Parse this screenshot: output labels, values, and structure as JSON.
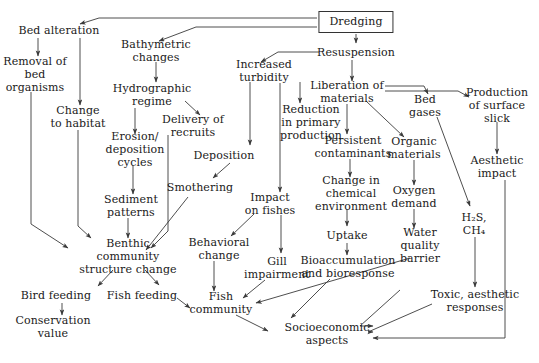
{
  "figure": {
    "type": "flowchart",
    "background_color": "#ffffff",
    "line_color": "#3a3a3a",
    "text_color": "#1a1a1a"
  },
  "nodes": [
    {
      "id": "dredging",
      "label": "Dredging",
      "x": 356,
      "y": 22,
      "boxed": true
    },
    {
      "id": "bed_alteration",
      "label": "Bed alteration",
      "x": 59,
      "y": 30,
      "boxed": false
    },
    {
      "id": "removal_bed_org",
      "label": "Removal of\nbed\norganisms",
      "x": 35,
      "y": 74,
      "boxed": false
    },
    {
      "id": "change_habitat",
      "label": "Change\nto habitat",
      "x": 78,
      "y": 117,
      "boxed": false
    },
    {
      "id": "bathymetric",
      "label": "Bathymetric\nchanges",
      "x": 156,
      "y": 51,
      "boxed": false
    },
    {
      "id": "hydrographic",
      "label": "Hydrographic\nregime",
      "x": 152,
      "y": 95,
      "boxed": false
    },
    {
      "id": "erosion",
      "label": "Erosion/\ndeposition\ncycles",
      "x": 135,
      "y": 149,
      "boxed": false
    },
    {
      "id": "sediment_patt",
      "label": "Sediment\npatterns",
      "x": 131,
      "y": 206,
      "boxed": false
    },
    {
      "id": "delivery",
      "label": "Delivery of\nrecruits",
      "x": 193,
      "y": 126,
      "boxed": false
    },
    {
      "id": "increased_turb",
      "label": "Increased\nturbidity",
      "x": 264,
      "y": 71,
      "boxed": false
    },
    {
      "id": "reduction_prim",
      "label": "Reduction\nin primary\nproduction",
      "x": 311,
      "y": 122,
      "boxed": false
    },
    {
      "id": "deposition",
      "label": "Deposition",
      "x": 224,
      "y": 155,
      "boxed": false
    },
    {
      "id": "smothering",
      "label": "Smothering",
      "x": 200,
      "y": 187,
      "boxed": false
    },
    {
      "id": "impact_fishes",
      "label": "Impact\non fishes",
      "x": 270,
      "y": 204,
      "boxed": false
    },
    {
      "id": "resuspension",
      "label": "Resuspension",
      "x": 356,
      "y": 52,
      "boxed": false
    },
    {
      "id": "liberation",
      "label": "Liberation of\nmaterials",
      "x": 347,
      "y": 92,
      "boxed": false
    },
    {
      "id": "persistent",
      "label": "Persistent\ncontaminants",
      "x": 353,
      "y": 147,
      "boxed": false
    },
    {
      "id": "change_chem",
      "label": "Change in\nchemical\nenvironment",
      "x": 351,
      "y": 193,
      "boxed": false
    },
    {
      "id": "uptake",
      "label": "Uptake",
      "x": 347,
      "y": 235,
      "boxed": false
    },
    {
      "id": "bioaccumulation",
      "label": "Bioaccumulation\nand bioresponse",
      "x": 348,
      "y": 267,
      "boxed": false
    },
    {
      "id": "bed_gases",
      "label": "Bed\ngases",
      "x": 425,
      "y": 106,
      "boxed": false
    },
    {
      "id": "organic_mats",
      "label": "Organic\nmaterials",
      "x": 414,
      "y": 148,
      "boxed": false
    },
    {
      "id": "oxygen_demand",
      "label": "Oxygen\ndemand",
      "x": 414,
      "y": 197,
      "boxed": false
    },
    {
      "id": "water_quality",
      "label": "Water\nquality\nbarrier",
      "x": 420,
      "y": 245,
      "boxed": false
    },
    {
      "id": "h2s_ch4",
      "label": "H₂S,\nCH₄",
      "x": 474,
      "y": 224,
      "boxed": false
    },
    {
      "id": "production_slick",
      "label": "Production\nof surface\nslick",
      "x": 497,
      "y": 105,
      "boxed": false
    },
    {
      "id": "aesthetic_impact",
      "label": "Aesthetic\nimpact",
      "x": 497,
      "y": 167,
      "boxed": false
    },
    {
      "id": "toxic_aesthetic",
      "label": "Toxic, aesthetic\nresponses",
      "x": 475,
      "y": 301,
      "boxed": false
    },
    {
      "id": "benthic",
      "label": "Benthic\ncommunity\nstructure change",
      "x": 128,
      "y": 256,
      "boxed": false
    },
    {
      "id": "behavioral",
      "label": "Behavioral\nchange",
      "x": 219,
      "y": 249,
      "boxed": false
    },
    {
      "id": "gill",
      "label": "Gill\nimpairment",
      "x": 277,
      "y": 268,
      "boxed": false
    },
    {
      "id": "bird_feeding",
      "label": "Bird feeding",
      "x": 56,
      "y": 295,
      "boxed": false
    },
    {
      "id": "fish_feeding",
      "label": "Fish feeding",
      "x": 142,
      "y": 295,
      "boxed": false
    },
    {
      "id": "conservation",
      "label": "Conservation\nvalue",
      "x": 53,
      "y": 327,
      "boxed": false
    },
    {
      "id": "fish_community",
      "label": "Fish\ncommunity",
      "x": 221,
      "y": 303,
      "boxed": false
    },
    {
      "id": "socioeconomic",
      "label": "Socioeconomic\naspects",
      "x": 327,
      "y": 334,
      "boxed": false
    }
  ],
  "edges": [
    {
      "from": "dredging",
      "to": "bed_alteration"
    },
    {
      "from": "dredging",
      "to": "bathymetric"
    },
    {
      "from": "dredging",
      "to": "resuspension"
    },
    {
      "from": "bed_alteration",
      "to": "removal_bed_org"
    },
    {
      "from": "bed_alteration",
      "to": "change_habitat"
    },
    {
      "from": "removal_bed_org",
      "to": "benthic"
    },
    {
      "from": "change_habitat",
      "to": "benthic"
    },
    {
      "from": "bathymetric",
      "to": "hydrographic"
    },
    {
      "from": "hydrographic",
      "to": "erosion"
    },
    {
      "from": "hydrographic",
      "to": "delivery"
    },
    {
      "from": "erosion",
      "to": "sediment_patt"
    },
    {
      "from": "sediment_patt",
      "to": "benthic"
    },
    {
      "from": "delivery",
      "to": "benthic"
    },
    {
      "from": "resuspension",
      "to": "increased_turb"
    },
    {
      "from": "resuspension",
      "to": "liberation"
    },
    {
      "from": "increased_turb",
      "to": "deposition"
    },
    {
      "from": "increased_turb",
      "to": "reduction_prim"
    },
    {
      "from": "deposition",
      "to": "smothering"
    },
    {
      "from": "smothering",
      "to": "benthic"
    },
    {
      "from": "reduction_prim",
      "to": "impact_fishes"
    },
    {
      "from": "impact_fishes",
      "to": "behavioral"
    },
    {
      "from": "impact_fishes",
      "to": "gill"
    },
    {
      "from": "behavioral",
      "to": "fish_community"
    },
    {
      "from": "gill",
      "to": "fish_community"
    },
    {
      "from": "liberation",
      "to": "persistent"
    },
    {
      "from": "liberation",
      "to": "organic_mats"
    },
    {
      "from": "liberation",
      "to": "bed_gases"
    },
    {
      "from": "liberation",
      "to": "production_slick"
    },
    {
      "from": "persistent",
      "to": "change_chem"
    },
    {
      "from": "change_chem",
      "to": "uptake"
    },
    {
      "from": "uptake",
      "to": "bioaccumulation"
    },
    {
      "from": "bioaccumulation",
      "to": "socioeconomic"
    },
    {
      "from": "organic_mats",
      "to": "oxygen_demand"
    },
    {
      "from": "oxygen_demand",
      "to": "water_quality"
    },
    {
      "from": "water_quality",
      "to": "fish_community"
    },
    {
      "from": "bed_gases",
      "to": "h2s_ch4"
    },
    {
      "from": "h2s_ch4",
      "to": "toxic_aesthetic"
    },
    {
      "from": "production_slick",
      "to": "aesthetic_impact"
    },
    {
      "from": "aesthetic_impact",
      "to": "socioeconomic"
    },
    {
      "from": "toxic_aesthetic",
      "to": "socioeconomic"
    },
    {
      "from": "benthic",
      "to": "bird_feeding"
    },
    {
      "from": "benthic",
      "to": "fish_feeding"
    },
    {
      "from": "bird_feeding",
      "to": "conservation"
    },
    {
      "from": "fish_feeding",
      "to": "fish_community"
    },
    {
      "from": "fish_community",
      "to": "socioeconomic"
    }
  ]
}
